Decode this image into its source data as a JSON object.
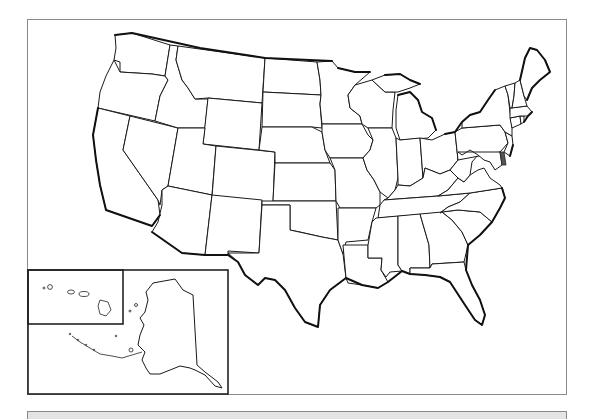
{
  "map": {
    "type": "blank outline map",
    "subject": "United States",
    "labels_visible": false,
    "regions": [
      "Washington",
      "Oregon",
      "California",
      "Nevada",
      "Idaho",
      "Montana",
      "Wyoming",
      "Utah",
      "Arizona",
      "Colorado",
      "New Mexico",
      "North Dakota",
      "South Dakota",
      "Nebraska",
      "Kansas",
      "Oklahoma",
      "Texas",
      "Minnesota",
      "Iowa",
      "Missouri",
      "Arkansas",
      "Louisiana",
      "Wisconsin",
      "Illinois",
      "Michigan",
      "Indiana",
      "Ohio",
      "Kentucky",
      "Tennessee",
      "Mississippi",
      "Alabama",
      "Georgia",
      "Florida",
      "South Carolina",
      "North Carolina",
      "Virginia",
      "West Virginia",
      "Pennsylvania",
      "New York",
      "Maryland",
      "Delaware",
      "New Jersey",
      "Connecticut",
      "Rhode Island",
      "Massachusetts",
      "Vermont",
      "New Hampshire",
      "Maine"
    ],
    "insets": [
      {
        "name": "Hawaii",
        "position": "lower-left top"
      },
      {
        "name": "Alaska",
        "position": "lower-left"
      }
    ],
    "colors": {
      "background": "#ffffff",
      "state_fill": "#ffffff",
      "border": "#1a1a1a",
      "frame": "#8a8a8a",
      "bottom_band": "#e4e4e4"
    }
  }
}
